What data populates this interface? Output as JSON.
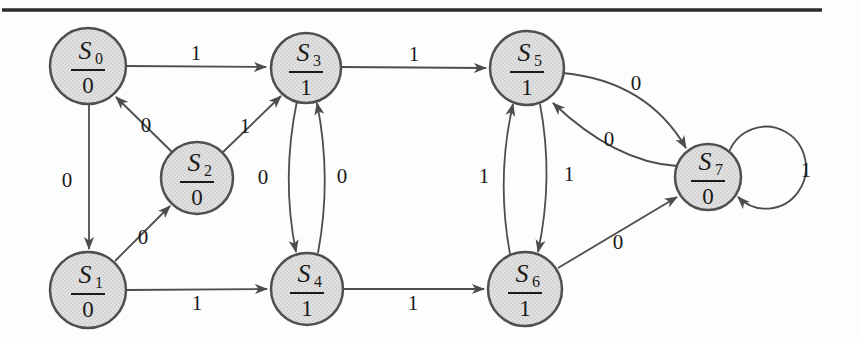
{
  "figure": {
    "kind": "state-transition-diagram"
  },
  "colors": {
    "background": "#fdfdfd",
    "node_fill_base": "#e1e1e1",
    "node_fill_dot": "#c9c9c9",
    "node_stroke": "#4f4f4f",
    "edge_stroke": "#4d4d4d",
    "text": "#1a1a1a",
    "top_rule": "#2d2d2d"
  },
  "top_rule": {
    "x1": 2,
    "x2": 822,
    "y": 10,
    "thickness": 3.4
  },
  "states": [
    {
      "id": "S0",
      "name": "S",
      "subscript": "0",
      "output": "0",
      "x": 88,
      "y": 66,
      "r": 38
    },
    {
      "id": "S1",
      "name": "S",
      "subscript": "1",
      "output": "0",
      "x": 88,
      "y": 290,
      "r": 38
    },
    {
      "id": "S2",
      "name": "S",
      "subscript": "2",
      "output": "0",
      "x": 197,
      "y": 178,
      "r": 36
    },
    {
      "id": "S3",
      "name": "S",
      "subscript": "3",
      "output": "1",
      "x": 306,
      "y": 68,
      "r": 35
    },
    {
      "id": "S4",
      "name": "S",
      "subscript": "4",
      "output": "1",
      "x": 307,
      "y": 289,
      "r": 36
    },
    {
      "id": "S5",
      "name": "S",
      "subscript": "5",
      "output": "1",
      "x": 527,
      "y": 68,
      "r": 37
    },
    {
      "id": "S6",
      "name": "S",
      "subscript": "6",
      "output": "1",
      "x": 525,
      "y": 289,
      "r": 37
    },
    {
      "id": "S7",
      "name": "S",
      "subscript": "7",
      "output": "0",
      "x": 708,
      "y": 177,
      "r": 33
    }
  ],
  "transitions": [
    {
      "from": "S0",
      "to": "S3",
      "input": "1",
      "path": "M 126 66 L 266 67",
      "label": {
        "x": 196,
        "y": 53
      }
    },
    {
      "from": "S0",
      "to": "S1",
      "input": "0",
      "path": "M 89 104 L 89 249",
      "label": {
        "x": 67,
        "y": 180
      }
    },
    {
      "from": "S2",
      "to": "S0",
      "input": "0",
      "path": "M 172 152 L 116 97",
      "label": {
        "x": 146,
        "y": 125
      }
    },
    {
      "from": "S2",
      "to": "S3",
      "input": "1",
      "path": "M 223 152 L 281 96",
      "label": {
        "x": 245,
        "y": 126
      }
    },
    {
      "from": "S1",
      "to": "S2",
      "input": "0",
      "path": "M 115 261 L 170 206",
      "label": {
        "x": 143,
        "y": 237
      }
    },
    {
      "from": "S3",
      "to": "S4",
      "input": "0",
      "path": "M 297 101 Q 281 178 296 252",
      "label": {
        "x": 263,
        "y": 177
      }
    },
    {
      "from": "S4",
      "to": "S3",
      "input": "0",
      "path": "M 318 253 Q 332 178 317 103",
      "label": {
        "x": 342,
        "y": 176
      }
    },
    {
      "from": "S1",
      "to": "S4",
      "input": "1",
      "path": "M 127 290 L 267 289",
      "label": {
        "x": 197,
        "y": 303
      }
    },
    {
      "from": "S3",
      "to": "S5",
      "input": "1",
      "path": "M 341 67 L 486 68",
      "label": {
        "x": 414,
        "y": 54
      }
    },
    {
      "from": "S4",
      "to": "S6",
      "input": "1",
      "path": "M 343 289 L 484 289",
      "label": {
        "x": 413,
        "y": 303
      }
    },
    {
      "from": "S6",
      "to": "S5",
      "input": "1",
      "path": "M 510 254 Q 496 178 513 104",
      "label": {
        "x": 484,
        "y": 176
      }
    },
    {
      "from": "S5",
      "to": "S6",
      "input": "1",
      "path": "M 540 104 Q 554 178 538 252",
      "label": {
        "x": 569,
        "y": 174
      }
    },
    {
      "from": "S5",
      "to": "S7",
      "input": "0",
      "path": "M 563 73 Q 647 81 686 148",
      "label": {
        "x": 636,
        "y": 83
      }
    },
    {
      "from": "S7",
      "to": "S5",
      "input": "0",
      "path": "M 677 166 Q 615 162 553 103",
      "label": {
        "x": 609,
        "y": 139
      }
    },
    {
      "from": "S6",
      "to": "S7",
      "input": "0",
      "path": "M 558 268 L 677 197",
      "label": {
        "x": 618,
        "y": 242
      }
    },
    {
      "from": "S7",
      "to": "S7",
      "input": "1",
      "path": "M 729 152 A 40 41 0 1 1 738 197",
      "label": {
        "x": 806,
        "y": 170
      }
    }
  ]
}
